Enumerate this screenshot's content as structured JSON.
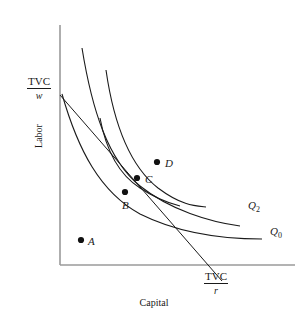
{
  "figure": {
    "type": "isoquant-isocost-diagram",
    "width": 306,
    "height": 324,
    "background": "#ffffff",
    "ink_color": "#1a1a1a",
    "axis_color": "#9a9a9a"
  },
  "axes": {
    "x_label": "Capital",
    "y_label": "Labor",
    "origin": {
      "x": 60,
      "y": 265
    },
    "x_end": {
      "x": 295,
      "y": 265
    },
    "y_end": {
      "x": 60,
      "y": 25
    }
  },
  "intercepts": {
    "vertical": {
      "numerator": "TVC",
      "denominator": "w",
      "name": "labor-intercept"
    },
    "horizontal": {
      "numerator": "TVC",
      "denominator": "r",
      "name": "capital-intercept"
    }
  },
  "isocost": {
    "label": "isocost-line",
    "start": {
      "x": 60,
      "y": 95
    },
    "end": {
      "x": 222,
      "y": 281
    }
  },
  "isoquants": [
    {
      "id": "q2",
      "label": "Q",
      "subscript": "2",
      "label_pos": {
        "x": 248,
        "y": 205
      },
      "path": "M 82,48 C 92,110 108,160 140,186 C 170,210 210,222 240,226"
    },
    {
      "id": "q0",
      "label": "Q",
      "subscript": "0",
      "label_pos": {
        "x": 270,
        "y": 231
      },
      "path": "M 62,94 C 78,150 100,192 140,214 C 180,234 226,239 262,239"
    },
    {
      "id": "q-middle",
      "label": "",
      "subscript": "",
      "label_pos": null,
      "path": "M 106,70 C 114,126 130,166 158,188 C 182,206 196,206 206,207"
    },
    {
      "id": "q-short",
      "label": "",
      "subscript": "",
      "label_pos": null,
      "path": "M 100,118 C 106,150 118,174 140,188 C 158,200 172,204 180,206"
    }
  ],
  "points": [
    {
      "id": "A",
      "label": "A",
      "x": 81,
      "y": 240,
      "label_dx": 7,
      "label_dy": 4
    },
    {
      "id": "B",
      "label": "B",
      "x": 125,
      "y": 192,
      "label_dx": -3,
      "label_dy": 17
    },
    {
      "id": "C",
      "label": "C",
      "x": 137,
      "y": 178,
      "label_dx": 8,
      "label_dy": 7
    },
    {
      "id": "D",
      "label": "D",
      "x": 157,
      "y": 162,
      "label_dx": 8,
      "label_dy": 5
    }
  ]
}
